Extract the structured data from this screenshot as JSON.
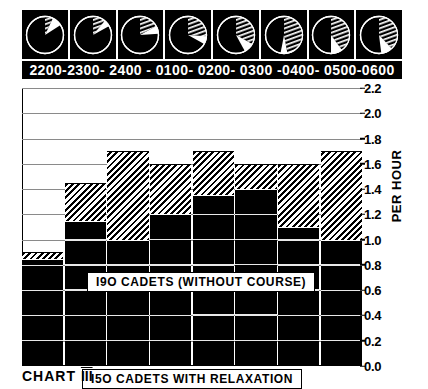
{
  "chart_data": {
    "type": "bar",
    "title": "CHART III",
    "xlabel": "",
    "ylabel": "PER HOUR",
    "ylim": [
      0.0,
      2.2
    ],
    "ytick_labels": [
      "2.2",
      "2.0",
      "1.8",
      "1.6",
      "1.4",
      "1.2",
      "1.0",
      "0.8",
      "0.6",
      "0.4",
      "0.2",
      "0.0"
    ],
    "ytick_values": [
      2.2,
      2.0,
      1.8,
      1.6,
      1.4,
      1.2,
      1.0,
      0.8,
      0.6,
      0.4,
      0.2,
      0.0
    ],
    "grid": true,
    "legend_position": "inside-plot",
    "categories": [
      "2200-2300",
      "2300-2400",
      "2400-0100",
      "0100-0200",
      "0200-0300",
      "0300-0400",
      "0400-0500",
      "0500-0600"
    ],
    "time_band_label": "2200-2300- 2400 - 0100-  0200- 0300 -0400- 0500-0600",
    "series": [
      {
        "name": "190 CADETS (WITHOUT COURSE)",
        "pattern": "diagonal-hatch",
        "values": [
          0.9,
          1.45,
          1.7,
          1.6,
          1.7,
          1.6,
          1.6,
          1.7
        ]
      },
      {
        "name": "150 CADETS WITH RELAXATION",
        "pattern": "solid-black",
        "values": [
          0.85,
          1.15,
          1.0,
          1.2,
          1.35,
          1.4,
          1.1,
          1.0
        ]
      }
    ],
    "annotations": [
      {
        "text": "190  CADETS (WITHOUT   COURSE)",
        "target": "upper-hatched-series"
      },
      {
        "text": "I5O   CADETS  WITH   RELAXATION",
        "target": "lower-black-series"
      }
    ],
    "pie_row": {
      "description": "Eight pie icons above the time axis showing the hatched proportion growing across the night",
      "hatched_fraction": [
        0.07,
        0.11,
        0.17,
        0.26,
        0.33,
        0.47,
        0.4,
        0.38
      ],
      "white_fraction": [
        0.09,
        0.06,
        0.07,
        0.07,
        0.09,
        0.06,
        0.1,
        0.1
      ]
    }
  },
  "labels": {
    "y_axis_title": "PER HOUR",
    "caption_word": "CHART",
    "caption_numeral": "III",
    "legend_upper": "I9O   CADETS (WITHOUT   COURSE)",
    "legend_lower": "I5O   CADETS  WITH   RELAXATION",
    "time_axis": "2200-2300- 2400 - 0100-  0200- 0300 -0400- 0500-0600"
  },
  "colors": {
    "ink": "#000000",
    "paper": "#ffffff",
    "grid": "#8a8a8a"
  }
}
